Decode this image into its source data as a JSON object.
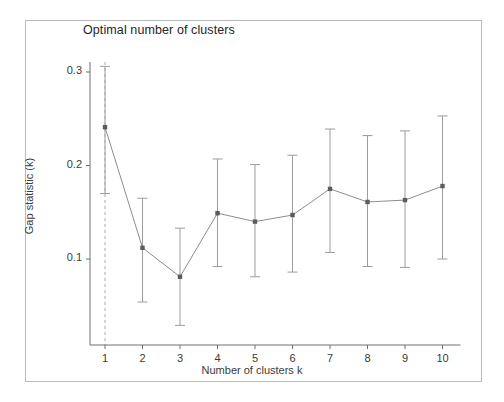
{
  "chart_data": {
    "type": "line",
    "title": "Optimal number of clusters",
    "xlabel": "Number of clusters k",
    "ylabel": "Gap statistic (k)",
    "x": [
      1,
      2,
      3,
      4,
      5,
      6,
      7,
      8,
      9,
      10
    ],
    "values": [
      0.241,
      0.112,
      0.081,
      0.149,
      0.14,
      0.147,
      0.175,
      0.161,
      0.163,
      0.178
    ],
    "err_lower": [
      0.17,
      0.054,
      0.029,
      0.092,
      0.081,
      0.086,
      0.107,
      0.092,
      0.091,
      0.1
    ],
    "err_upper": [
      0.306,
      0.165,
      0.133,
      0.207,
      0.201,
      0.211,
      0.239,
      0.232,
      0.237,
      0.253
    ],
    "xtick_labels": [
      "1",
      "2",
      "3",
      "4",
      "5",
      "6",
      "7",
      "8",
      "9",
      "10"
    ],
    "ytick_labels": [
      "0.1",
      "0.2",
      "0.3"
    ],
    "ytick_values": [
      0.1,
      0.2,
      0.3
    ],
    "xlim": [
      0.6,
      10.5
    ],
    "ylim": [
      0.02,
      0.315
    ],
    "grid": false,
    "legend": "none",
    "optimal_k": 1,
    "annotations": [
      {
        "type": "vertical-dashed-line",
        "at_x": 1,
        "label": "optimal-k-marker"
      }
    ],
    "series_color": "#8b8d90",
    "point_color": "#5a5c5f",
    "errorbar_color": "#9a9c9f",
    "dashed_line_color": "#a8aaad",
    "axis_color": "#6e7073",
    "frame_color": "#b9bcbe",
    "text_color": "#3a3a3a"
  }
}
